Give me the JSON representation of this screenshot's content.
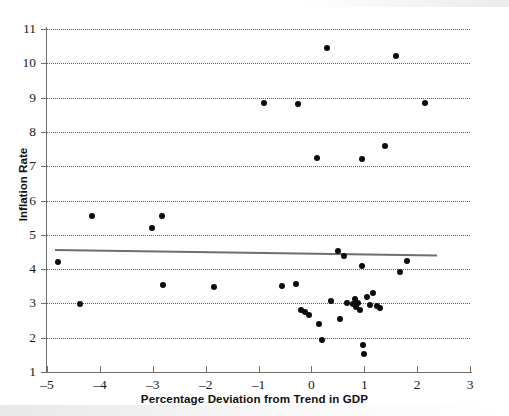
{
  "chart_data": {
    "type": "scatter",
    "title": "",
    "xlabel": "Percentage Deviation from Trend in GDP",
    "ylabel": "Inflation Rate",
    "xlim": [
      -5,
      3
    ],
    "ylim": [
      1,
      11
    ],
    "xticks": [
      -5,
      -4,
      -3,
      -2,
      -1,
      0,
      1,
      2,
      3
    ],
    "xticklabels": [
      "–5",
      "–4",
      "–3",
      "–2",
      "–1",
      "0",
      "1",
      "2",
      "3"
    ],
    "yticks": [
      1,
      2,
      3,
      4,
      5,
      6,
      7,
      8,
      9,
      10,
      11
    ],
    "yticklabels": [
      "1",
      "2",
      "3",
      "4",
      "5",
      "6",
      "7",
      "8",
      "9",
      "10",
      "11"
    ],
    "grid": "horizontal-dotted",
    "legend": "none",
    "marker": {
      "shape": "circle",
      "color": "#0b0b0b",
      "size": 6
    },
    "points": [
      {
        "x": -4.8,
        "y": 4.22
      },
      {
        "x": -4.37,
        "y": 2.97
      },
      {
        "x": -4.15,
        "y": 5.56
      },
      {
        "x": -3.02,
        "y": 5.2
      },
      {
        "x": -2.83,
        "y": 5.56
      },
      {
        "x": -2.8,
        "y": 3.55
      },
      {
        "x": -1.85,
        "y": 3.48
      },
      {
        "x": -0.9,
        "y": 8.85
      },
      {
        "x": -0.55,
        "y": 3.5
      },
      {
        "x": -0.3,
        "y": 3.58
      },
      {
        "x": -0.25,
        "y": 8.8
      },
      {
        "x": -0.2,
        "y": 2.82
      },
      {
        "x": -0.12,
        "y": 2.75
      },
      {
        "x": -0.05,
        "y": 2.65
      },
      {
        "x": 0.1,
        "y": 7.25
      },
      {
        "x": 0.15,
        "y": 2.4
      },
      {
        "x": 0.2,
        "y": 1.92
      },
      {
        "x": 0.3,
        "y": 10.45
      },
      {
        "x": 0.38,
        "y": 3.08
      },
      {
        "x": 0.5,
        "y": 4.52
      },
      {
        "x": 0.55,
        "y": 2.55
      },
      {
        "x": 0.62,
        "y": 4.38
      },
      {
        "x": 0.68,
        "y": 3.0
      },
      {
        "x": 0.78,
        "y": 2.98
      },
      {
        "x": 0.82,
        "y": 3.12
      },
      {
        "x": 0.85,
        "y": 2.9
      },
      {
        "x": 0.88,
        "y": 3.02
      },
      {
        "x": 0.92,
        "y": 2.82
      },
      {
        "x": 0.95,
        "y": 7.2
      },
      {
        "x": 0.95,
        "y": 4.1
      },
      {
        "x": 0.98,
        "y": 1.78
      },
      {
        "x": 1.0,
        "y": 1.52
      },
      {
        "x": 1.05,
        "y": 3.18
      },
      {
        "x": 1.1,
        "y": 2.95
      },
      {
        "x": 1.16,
        "y": 3.3
      },
      {
        "x": 1.25,
        "y": 2.92
      },
      {
        "x": 1.3,
        "y": 2.88
      },
      {
        "x": 1.4,
        "y": 7.6
      },
      {
        "x": 1.6,
        "y": 10.2
      },
      {
        "x": 1.67,
        "y": 3.93
      },
      {
        "x": 1.8,
        "y": 4.25
      },
      {
        "x": 2.15,
        "y": 8.85
      }
    ],
    "trendline": {
      "x0": -4.85,
      "y0": 4.58,
      "x1": 2.38,
      "y1": 4.42,
      "color": "#6e6e6e"
    }
  }
}
